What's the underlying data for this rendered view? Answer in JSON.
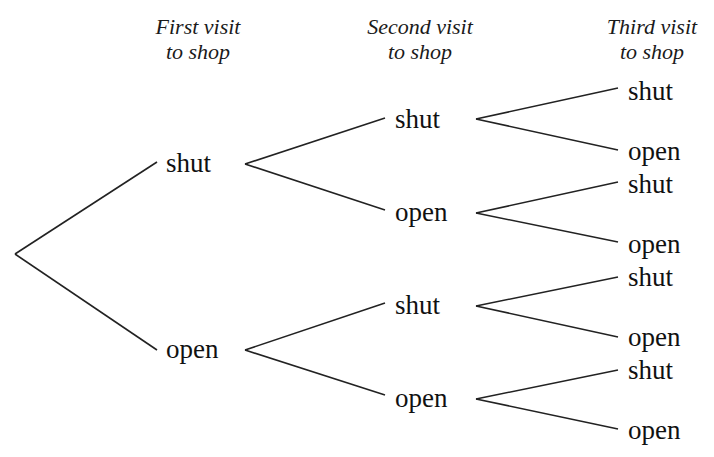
{
  "headers": {
    "first": {
      "line1": "First visit",
      "line2": "to shop"
    },
    "second": {
      "line1": "Second visit",
      "line2": "to shop"
    },
    "third": {
      "line1": "Third visit",
      "line2": "to shop"
    }
  },
  "tree": {
    "level1": [
      "shut",
      "open"
    ],
    "level2": [
      "shut",
      "open",
      "shut",
      "open"
    ],
    "level3": [
      "shut",
      "open",
      "shut",
      "open",
      "shut",
      "open",
      "shut",
      "open"
    ]
  },
  "colors": {
    "line": "#222222",
    "text": "#111111"
  }
}
